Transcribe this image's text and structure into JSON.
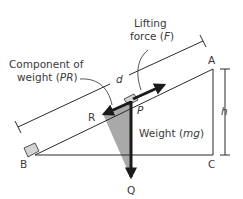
{
  "diagram": {
    "type": "inclined-plane-force-diagram",
    "labels": {
      "lifting_force_line1": "Lifting",
      "lifting_force_line2_pre": "force (",
      "lifting_force_symbol": "F",
      "lifting_force_line2_post": ")",
      "component_line1": "Component of",
      "component_line2_pre": "weight (",
      "component_symbol": "PR",
      "component_line2_post": ")",
      "weight_pre": "Weight (",
      "weight_symbol": "mg",
      "weight_post": ")",
      "distance": "d",
      "height": "h"
    },
    "points": {
      "A": "A",
      "B": "B",
      "C": "C",
      "P": "P",
      "R": "R",
      "Q": "Q"
    },
    "colors": {
      "line": "#2a2a2a",
      "arrow": "#1a1a1a",
      "shade": "#a0a0a0",
      "block": "#d4d4d4",
      "text": "#3a3a3a"
    }
  }
}
